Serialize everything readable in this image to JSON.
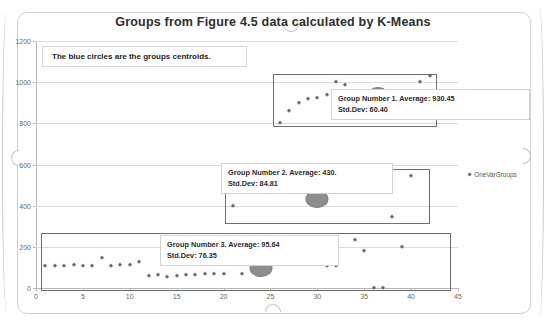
{
  "chart_data": {
    "type": "scatter",
    "title": "Groups from Figure 4.5 data calculated by K-Means",
    "xlabel": "",
    "ylabel": "",
    "xlim": [
      0,
      45
    ],
    "ylim": [
      0,
      1200
    ],
    "xticks": [
      0,
      5,
      10,
      15,
      20,
      25,
      30,
      35,
      40,
      45
    ],
    "yticks": [
      0,
      200,
      400,
      600,
      800,
      1000,
      1200
    ],
    "grid": "horizontal",
    "legend_position": "right",
    "legend": [
      "OneVarGroups"
    ],
    "annotation": "The blue circles are the groups centroids.",
    "series": [
      {
        "name": "OneVarGroups",
        "marker": "diamond",
        "color": "#6b6f7d",
        "points": [
          [
            1,
            105
          ],
          [
            2,
            107
          ],
          [
            3,
            105
          ],
          [
            4,
            110
          ],
          [
            5,
            108
          ],
          [
            6,
            106
          ],
          [
            7,
            145
          ],
          [
            8,
            106
          ],
          [
            9,
            110
          ],
          [
            10,
            112
          ],
          [
            11,
            128
          ],
          [
            12,
            60
          ],
          [
            13,
            62
          ],
          [
            14,
            55
          ],
          [
            15,
            57
          ],
          [
            16,
            62
          ],
          [
            17,
            65
          ],
          [
            18,
            66
          ],
          [
            19,
            68
          ],
          [
            20,
            68
          ],
          [
            22,
            66
          ],
          [
            21,
            400
          ],
          [
            26,
            800
          ],
          [
            27,
            860
          ],
          [
            28,
            900
          ],
          [
            29,
            920
          ],
          [
            30,
            925
          ],
          [
            31,
            940
          ],
          [
            32,
            1000
          ],
          [
            33,
            985
          ],
          [
            35,
            890
          ],
          [
            31,
            105
          ],
          [
            32,
            108
          ],
          [
            34,
            235
          ],
          [
            35,
            180
          ],
          [
            36,
            0
          ],
          [
            37,
            0
          ],
          [
            38,
            345
          ],
          [
            39,
            200
          ],
          [
            40,
            545
          ],
          [
            41,
            1000
          ],
          [
            42,
            1030
          ]
        ]
      }
    ],
    "centroids": [
      {
        "group": 1,
        "x": 36.5,
        "y": 930.45,
        "average": 930.45,
        "std_dev": 60.4
      },
      {
        "group": 2,
        "x": 30.0,
        "y": 430.0,
        "average": 430.0,
        "std_dev": 84.81
      },
      {
        "group": 3,
        "x": 24.0,
        "y": 95.64,
        "average": 95.64,
        "std_dev": 76.35
      }
    ],
    "group_boxes": [
      {
        "group": 1,
        "x0": 25.3,
        "x1": 42.5,
        "y0": 790,
        "y1": 1040
      },
      {
        "group": 2,
        "x0": 20.2,
        "x1": 41.8,
        "y0": 320,
        "y1": 580
      },
      {
        "group": 3,
        "x0": 0.5,
        "x1": 44.0,
        "y0": -5,
        "y1": 265
      }
    ]
  },
  "callouts": [
    {
      "line1": "Group Number 1. Average: 930.45",
      "line2": "Std.Dev: 60.40"
    },
    {
      "line1": "Group Number 2. Average: 430.",
      "line2": "Std.Dev: 84.81"
    },
    {
      "line1": "Group Number 3. Average: 95.64",
      "line2": "Std.Dev: 76.35"
    }
  ],
  "note": {
    "text": "The blue circles are the groups centroids."
  },
  "legend": {
    "label": "OneVarGroups"
  },
  "axis": {
    "y": {
      "t0": "0",
      "t1": "200",
      "t2": "400",
      "t3": "600",
      "t4": "800",
      "t5": "1000",
      "t6": "1200"
    },
    "x": {
      "t0": "0",
      "t1": "5",
      "t2": "10",
      "t3": "15",
      "t4": "20",
      "t5": "25",
      "t6": "30",
      "t7": "35",
      "t8": "40",
      "t9": "45"
    }
  }
}
